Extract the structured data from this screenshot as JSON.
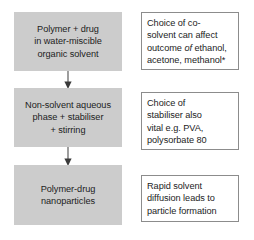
{
  "diagram": {
    "fill_color": "#cccccc",
    "border_color": "#8c8c8c",
    "text_color": "#1c1c1c",
    "background": "#ffffff",
    "stages": [
      {
        "id": "stage-1",
        "lines": [
          "Polymer + drug",
          "in water-miscible",
          "organic solvent"
        ],
        "text": "Polymer + drug in water-miscible organic solvent"
      },
      {
        "id": "stage-2",
        "lines": [
          "Non-solvent aqueous",
          "phase + stabiliser",
          "+ stirring"
        ],
        "text": "Non-solvent aqueous phase + stabiliser + stirring"
      },
      {
        "id": "stage-3",
        "lines": [
          "Polymer-drug",
          "nanoparticles"
        ],
        "text": "Polymer-drug nanoparticles"
      }
    ],
    "notes": [
      {
        "id": "note-1",
        "lines": [
          "Choice of co-",
          "solvent can affect",
          "outcome of ethanol,",
          "acetone, methanol*"
        ],
        "text": "Choice of co-solvent can affect outcome of ethanol, acetone, methanol*",
        "italic_word": "of"
      },
      {
        "id": "note-2",
        "lines": [
          "Choice of",
          "stabiliser also",
          "vital e.g. PVA,",
          "polysorbate 80"
        ],
        "text": "Choice of stabiliser also vital e.g. PVA, polysorbate 80"
      },
      {
        "id": "note-3",
        "lines": [
          "Rapid solvent",
          "diffusion leads to",
          "particle formation"
        ],
        "text": "Rapid solvent diffusion leads to particle formation"
      }
    ],
    "connectors": [
      {
        "id": "connector-1",
        "direction": "down"
      },
      {
        "id": "connector-2",
        "direction": "down"
      }
    ]
  }
}
